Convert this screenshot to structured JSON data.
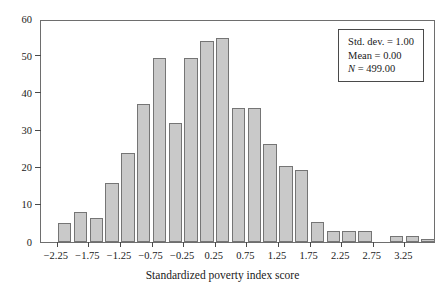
{
  "chart_data": {
    "type": "bar",
    "title": "",
    "subtitle": "",
    "xlabel": "Standardized poverty index score",
    "ylabel": "",
    "xlim": [
      -2.5,
      3.75
    ],
    "ylim": [
      0,
      60
    ],
    "grid": false,
    "legend_position": "top-right",
    "bin_width": 0.25,
    "x_tick_labels": [
      "−2.25",
      "−1.75",
      "−1.25",
      "−0.75",
      "−0.25",
      "0.25",
      "0.75",
      "1.25",
      "1.75",
      "2.25",
      "2.75",
      "3.25"
    ],
    "x_tick_values": [
      -2.25,
      -1.75,
      -1.25,
      -0.75,
      -0.25,
      0.25,
      0.75,
      1.25,
      1.75,
      2.25,
      2.75,
      3.25
    ],
    "y_tick_labels": [
      "0",
      "10",
      "20",
      "30",
      "40",
      "50",
      "60"
    ],
    "y_tick_values": [
      0,
      10,
      20,
      30,
      40,
      50,
      60
    ],
    "categories": [
      -2.25,
      -2.0,
      -1.75,
      -1.5,
      -1.25,
      -1.0,
      -0.75,
      -0.5,
      -0.25,
      0.0,
      0.25,
      0.5,
      0.75,
      1.0,
      1.25,
      1.5,
      1.75,
      2.0,
      2.25,
      2.5,
      2.75,
      3.0,
      3.25,
      3.5
    ],
    "values": [
      5,
      8,
      6.5,
      16,
      24,
      37,
      49.5,
      32,
      49.5,
      54,
      55,
      36,
      36,
      26.5,
      20.5,
      19.5,
      5.5,
      3,
      3,
      3,
      0,
      1.5,
      1.5,
      0.8
    ],
    "bar_fill_color": "#c9c9c9",
    "bar_edge_color": "#757575",
    "annotations": {
      "std_dev": "Std. dev. = 1.00",
      "mean": "Mean = 0.00",
      "n_label": "N",
      "n_value": " = 499.00"
    }
  },
  "figure": {
    "background_color": "#ffffff",
    "frame_color": "#6e6e6e"
  }
}
